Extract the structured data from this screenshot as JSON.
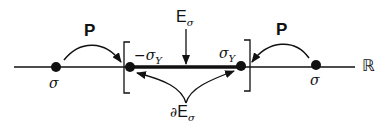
{
  "diagram": {
    "labels": {
      "left_map": "P",
      "right_map": "P",
      "left_point": "σ",
      "right_point": "σ",
      "lower_bound": "−σ",
      "lower_bound_sub": "Y",
      "upper_bound": "σ",
      "upper_bound_sub": "Y",
      "elastic_set": "E",
      "elastic_set_sub": "σ",
      "boundary_prefix": "∂",
      "boundary_set": "E",
      "boundary_set_sub": "σ",
      "real_line": "ℝ"
    },
    "colors": {
      "ink": "#111111",
      "background": "#ffffff"
    }
  }
}
